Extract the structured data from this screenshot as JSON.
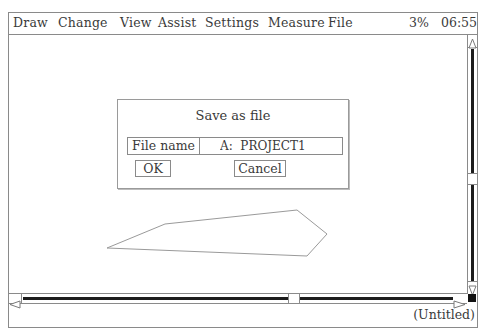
{
  "menubar": {
    "items": [
      {
        "label": "Draw",
        "x": 4
      },
      {
        "label": "Change",
        "x": 49
      },
      {
        "label": "View",
        "x": 111
      },
      {
        "label": "Assist",
        "x": 149
      },
      {
        "label": "Settings",
        "x": 196
      },
      {
        "label": "Measure",
        "x": 259
      },
      {
        "label": "File",
        "x": 319
      }
    ],
    "zoom_level": "3%",
    "clock": "06:55"
  },
  "dialog": {
    "title": "Save as file",
    "file_name_label": "File name",
    "file_name_value": "A:  PROJECT1",
    "ok_label": "OK",
    "cancel_label": "Cancel"
  },
  "canvas": {
    "shape": {
      "type": "polygon",
      "points": "98,235 156,211 288,197 318,221 298,243",
      "stroke": "#9a9a9a"
    }
  },
  "status": {
    "document_name": "(Untitled)"
  },
  "colors": {
    "border": "#8a8a8a",
    "text": "#3a3a3a",
    "scroll_track": "#1c1c1c",
    "background": "#ffffff"
  }
}
